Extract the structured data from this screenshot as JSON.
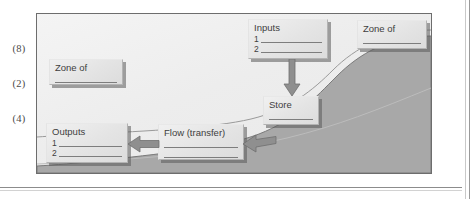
{
  "page": {
    "margin_marks": [
      "(8)",
      "(2)",
      "(4)"
    ]
  },
  "diagram": {
    "boxes": {
      "inputs": {
        "title": "Inputs",
        "rows": [
          "1",
          "2"
        ]
      },
      "zone_top": {
        "title": "Zone of",
        "rows": [
          ""
        ]
      },
      "zone_left": {
        "title": "Zone of",
        "rows": [
          ""
        ]
      },
      "store": {
        "title": "Store",
        "rows": [
          ""
        ]
      },
      "flow": {
        "title": "Flow (transfer)",
        "rows": [
          "",
          ""
        ]
      },
      "outputs": {
        "title": "Outputs",
        "rows": [
          "1",
          "2"
        ]
      }
    },
    "arrows": [
      {
        "name": "inputs-to-store",
        "direction": "down"
      },
      {
        "name": "flow-to-outputs",
        "direction": "left"
      },
      {
        "name": "store-to-flow",
        "direction": "left"
      }
    ],
    "colors": {
      "hill_fill": "#a8a8a8",
      "hill_stroke": "#7a7a7a",
      "frame_border": "#6d6d6d",
      "box_fill": "#e8e8e8",
      "box_border": "#b3b3b3",
      "arrow_fill": "#8a8a8a",
      "text": "#3e3e3e"
    }
  }
}
